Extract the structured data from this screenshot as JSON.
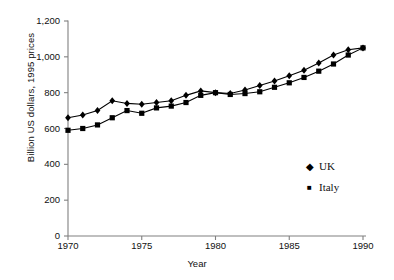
{
  "chart_data": {
    "type": "line",
    "title": "",
    "xlabel": "Year",
    "ylabel": "Billion US dollars, 1995 prices",
    "xlim": [
      1970,
      1990
    ],
    "ylim": [
      0,
      1200
    ],
    "ytick_labels": [
      "0",
      "200",
      "400",
      "600",
      "800",
      "1,000",
      "1,200"
    ],
    "ytick_values": [
      0,
      200,
      400,
      600,
      800,
      1000,
      1200
    ],
    "xtick_labels": [
      "1970",
      "1975",
      "1980",
      "1985",
      "1990"
    ],
    "xtick_values": [
      1970,
      1975,
      1980,
      1985,
      1990
    ],
    "grid": false,
    "legend_position": "right-lower",
    "x": [
      1970,
      1971,
      1972,
      1973,
      1974,
      1975,
      1976,
      1977,
      1978,
      1979,
      1980,
      1981,
      1982,
      1983,
      1984,
      1985,
      1986,
      1987,
      1988,
      1989,
      1990
    ],
    "series": [
      {
        "name": "UK",
        "marker": "diamond",
        "values": [
          660,
          675,
          700,
          755,
          740,
          735,
          745,
          755,
          785,
          810,
          800,
          795,
          815,
          840,
          865,
          895,
          925,
          965,
          1010,
          1040,
          1050
        ]
      },
      {
        "name": "Italy",
        "marker": "square",
        "values": [
          590,
          600,
          620,
          660,
          700,
          685,
          715,
          725,
          745,
          785,
          800,
          790,
          795,
          805,
          830,
          855,
          885,
          920,
          960,
          1010,
          1050
        ]
      }
    ]
  },
  "legend": {
    "items": [
      {
        "label": "UK",
        "marker": "◆"
      },
      {
        "label": "Italy",
        "marker": "■"
      }
    ]
  }
}
